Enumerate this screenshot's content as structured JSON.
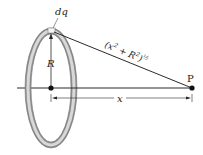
{
  "diagram": {
    "labels": {
      "charge_element": "dq",
      "radius": "R",
      "distance_expr_base": "(x",
      "distance_expr_exp1": "2",
      "distance_expr_mid": " + R",
      "distance_expr_exp2": "2",
      "distance_expr_close": ")",
      "distance_expr_power": "½",
      "point": "P",
      "axial_distance": "x"
    },
    "colors": {
      "ring_outer": "#9a9a9a",
      "ring_inner": "#d6d6d6",
      "line": "#2a2a2a",
      "point": "#111111"
    }
  }
}
